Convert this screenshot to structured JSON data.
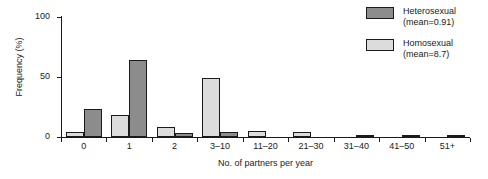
{
  "chart_data": {
    "type": "bar",
    "title": "",
    "xlabel": "No. of partners per year",
    "ylabel": "Frequency (%)",
    "categories": [
      "0",
      "1",
      "2",
      "3–10",
      "11–20",
      "21–30",
      "31–40",
      "41–50",
      "51+"
    ],
    "ylim": [
      0,
      100
    ],
    "yticks": [
      0,
      50,
      100
    ],
    "ytick_labels": [
      "0",
      "50",
      "100"
    ],
    "grid": false,
    "legend_position": "top-right",
    "series": [
      {
        "name": "Heterosexual",
        "legend_label": "Heterosexual",
        "mean_label": "(mean=0.91)",
        "color": "#8c8c8c",
        "edge_color": "#1a1a1a",
        "values": [
          23,
          64,
          3,
          4,
          0,
          0,
          2,
          2,
          2
        ]
      },
      {
        "name": "Homosexual",
        "legend_label": "Homosexual",
        "mean_label": "(mean=8.7)",
        "color": "#dcdcdc",
        "edge_color": "#1a1a1a",
        "values": [
          4,
          18,
          8,
          49,
          5,
          4,
          0,
          0,
          0
        ]
      }
    ]
  },
  "legend": {
    "entries": [
      {
        "label": "Heterosexual",
        "sublabel": "(mean=0.91)",
        "swatch": "#8c8c8c"
      },
      {
        "label": "Homosexual",
        "sublabel": "(mean=8.7)",
        "swatch": "#dcdcdc"
      }
    ]
  }
}
